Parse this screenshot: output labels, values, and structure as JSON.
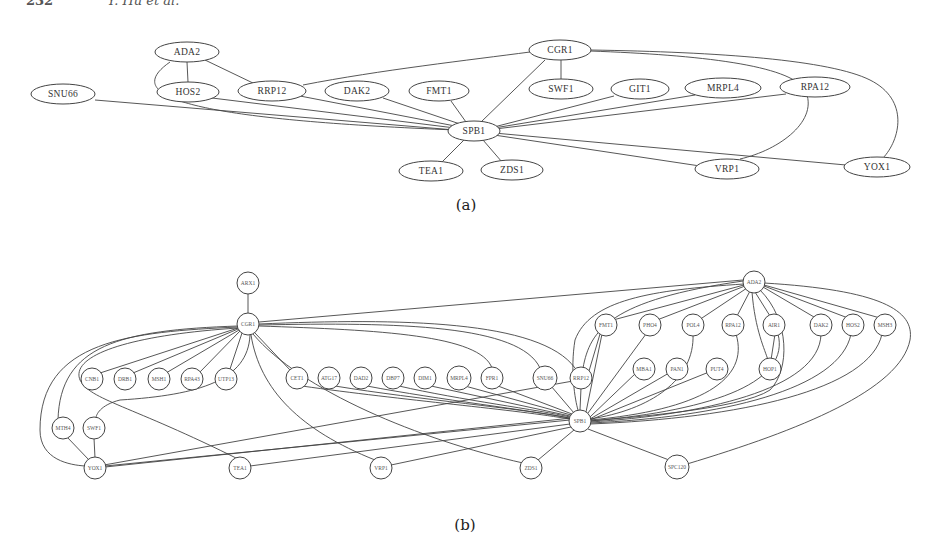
{
  "header": {
    "page_number": "232",
    "authors": "Y. Hu et al."
  },
  "figure_a": {
    "caption": "(a)",
    "center": "SPB1",
    "nodes": [
      {
        "id": "ADA2",
        "x": 187,
        "y": 52
      },
      {
        "id": "SNU66",
        "x": 63,
        "y": 94
      },
      {
        "id": "HOS2",
        "x": 188,
        "y": 92
      },
      {
        "id": "RRP12",
        "x": 272,
        "y": 91
      },
      {
        "id": "DAK2",
        "x": 357,
        "y": 91
      },
      {
        "id": "FMT1",
        "x": 439,
        "y": 91
      },
      {
        "id": "CGR1",
        "x": 560,
        "y": 50
      },
      {
        "id": "SWF1",
        "x": 561,
        "y": 89
      },
      {
        "id": "GIT1",
        "x": 640,
        "y": 89
      },
      {
        "id": "MRPL4",
        "x": 723,
        "y": 88
      },
      {
        "id": "RPA12",
        "x": 815,
        "y": 87
      },
      {
        "id": "SPB1",
        "x": 474,
        "y": 131
      },
      {
        "id": "TEA1",
        "x": 431,
        "y": 171
      },
      {
        "id": "ZDS1",
        "x": 512,
        "y": 170
      },
      {
        "id": "VRP1",
        "x": 727,
        "y": 169
      },
      {
        "id": "YOX1",
        "x": 877,
        "y": 167
      }
    ]
  },
  "figure_b": {
    "caption": "(b)",
    "nodes": [
      {
        "id": "ARX1",
        "x": 248,
        "y": 283
      },
      {
        "id": "CGR1",
        "x": 248,
        "y": 324
      },
      {
        "id": "ADA2",
        "x": 754,
        "y": 282
      },
      {
        "id": "CNB1",
        "x": 92,
        "y": 379
      },
      {
        "id": "DRB1",
        "x": 125,
        "y": 379
      },
      {
        "id": "MSH1",
        "x": 159,
        "y": 379
      },
      {
        "id": "RPA43",
        "x": 192,
        "y": 379
      },
      {
        "id": "UTP13",
        "x": 226,
        "y": 379
      },
      {
        "id": "CET1",
        "x": 297,
        "y": 378
      },
      {
        "id": "ATG17",
        "x": 329,
        "y": 378
      },
      {
        "id": "DAD2",
        "x": 361,
        "y": 378
      },
      {
        "id": "DBP7",
        "x": 393,
        "y": 378
      },
      {
        "id": "DIM1",
        "x": 425,
        "y": 378
      },
      {
        "id": "MRPL4",
        "x": 459,
        "y": 378
      },
      {
        "id": "FPR1",
        "x": 492,
        "y": 378
      },
      {
        "id": "SNU66",
        "x": 545,
        "y": 378
      },
      {
        "id": "RRP12",
        "x": 581,
        "y": 378
      },
      {
        "id": "FMT1",
        "x": 606,
        "y": 325
      },
      {
        "id": "PHO4",
        "x": 650,
        "y": 325
      },
      {
        "id": "POL4",
        "x": 693,
        "y": 325
      },
      {
        "id": "RPA12",
        "x": 733,
        "y": 325
      },
      {
        "id": "AIR1",
        "x": 774,
        "y": 325
      },
      {
        "id": "DAK2",
        "x": 821,
        "y": 325
      },
      {
        "id": "HOS2",
        "x": 853,
        "y": 325
      },
      {
        "id": "MSH3",
        "x": 885,
        "y": 325
      },
      {
        "id": "MBA1",
        "x": 644,
        "y": 369
      },
      {
        "id": "PAN1",
        "x": 677,
        "y": 369
      },
      {
        "id": "PUT4",
        "x": 717,
        "y": 369
      },
      {
        "id": "HOP1",
        "x": 770,
        "y": 369
      },
      {
        "id": "SPB1",
        "x": 580,
        "y": 421
      },
      {
        "id": "MTH4",
        "x": 63,
        "y": 428
      },
      {
        "id": "SWF1",
        "x": 94,
        "y": 428
      },
      {
        "id": "YOX1",
        "x": 95,
        "y": 468
      },
      {
        "id": "TEA1",
        "x": 240,
        "y": 468
      },
      {
        "id": "VRP1",
        "x": 381,
        "y": 468
      },
      {
        "id": "ZDS1",
        "x": 531,
        "y": 468
      },
      {
        "id": "SPC120",
        "x": 677,
        "y": 467
      }
    ]
  }
}
